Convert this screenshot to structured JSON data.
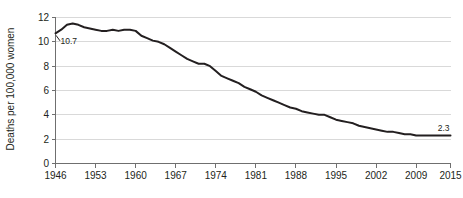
{
  "chart_data": {
    "type": "line",
    "title": "",
    "subtitle": "",
    "xlabel": "",
    "ylabel": "Deaths per 100,000 women",
    "xlim": [
      1946,
      2015
    ],
    "ylim": [
      0,
      12
    ],
    "grid": true,
    "legend": "none",
    "x_tick_labels": [
      "1946",
      "1953",
      "1960",
      "1967",
      "1974",
      "1981",
      "1988",
      "1995",
      "2002",
      "2009",
      "2015"
    ],
    "x_ticks": [
      1946,
      1953,
      1960,
      1967,
      1974,
      1981,
      1988,
      1995,
      2002,
      2009,
      2015
    ],
    "y_tick_labels": [
      "0",
      "2",
      "4",
      "6",
      "8",
      "10",
      "12"
    ],
    "y_ticks": [
      0,
      2,
      4,
      6,
      8,
      10,
      12
    ],
    "annotations": [
      {
        "label": "10.7",
        "x": 1946,
        "y": 10.7
      },
      {
        "label": "2.3",
        "x": 2015,
        "y": 2.3
      }
    ],
    "series": [
      {
        "name": "Deaths per 100,000 women",
        "color": "#231f20",
        "x": [
          1946,
          1947,
          1948,
          1949,
          1950,
          1951,
          1952,
          1953,
          1954,
          1955,
          1956,
          1957,
          1958,
          1959,
          1960,
          1961,
          1962,
          1963,
          1964,
          1965,
          1966,
          1967,
          1968,
          1969,
          1970,
          1971,
          1972,
          1973,
          1974,
          1975,
          1976,
          1977,
          1978,
          1979,
          1980,
          1981,
          1982,
          1983,
          1984,
          1985,
          1986,
          1987,
          1988,
          1989,
          1990,
          1991,
          1992,
          1993,
          1994,
          1995,
          1996,
          1997,
          1998,
          1999,
          2000,
          2001,
          2002,
          2003,
          2004,
          2005,
          2006,
          2007,
          2008,
          2009,
          2010,
          2011,
          2012,
          2013,
          2014,
          2015
        ],
        "values": [
          10.7,
          11.0,
          11.4,
          11.5,
          11.4,
          11.2,
          11.1,
          11.0,
          10.9,
          10.9,
          11.0,
          10.9,
          11.0,
          11.0,
          10.9,
          10.5,
          10.3,
          10.1,
          10.0,
          9.8,
          9.5,
          9.2,
          8.9,
          8.6,
          8.4,
          8.2,
          8.2,
          8.0,
          7.6,
          7.2,
          7.0,
          6.8,
          6.6,
          6.3,
          6.1,
          5.9,
          5.6,
          5.4,
          5.2,
          5.0,
          4.8,
          4.6,
          4.5,
          4.3,
          4.2,
          4.1,
          4.0,
          4.0,
          3.8,
          3.6,
          3.5,
          3.4,
          3.3,
          3.1,
          3.0,
          2.9,
          2.8,
          2.7,
          2.6,
          2.6,
          2.5,
          2.4,
          2.4,
          2.3,
          2.3,
          2.3,
          2.3,
          2.3,
          2.3,
          2.3
        ]
      }
    ]
  }
}
